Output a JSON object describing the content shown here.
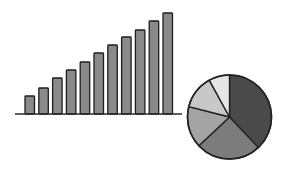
{
  "chart_data": [
    {
      "type": "bar",
      "title": "",
      "xlabel": "",
      "ylabel": "",
      "categories": [
        "1",
        "2",
        "3",
        "4",
        "5",
        "6",
        "7",
        "8",
        "9",
        "10",
        "11"
      ],
      "values": [
        18,
        26,
        36,
        44,
        52,
        61,
        69,
        77,
        84,
        93,
        101
      ],
      "grid": false,
      "legend": "none",
      "colors": {
        "fill": "#8a8a8a",
        "stroke": "#1e1e1e",
        "axis": "#2a2a2a"
      }
    },
    {
      "type": "pie",
      "title": "",
      "labels": [
        "A",
        "B",
        "C",
        "D",
        "E"
      ],
      "values": [
        38,
        25,
        16,
        13,
        8
      ],
      "start_angle": "12 o'clock, clockwise",
      "legend": "none",
      "colors": [
        "#4a4a4a",
        "#7c7c7c",
        "#a4a4a4",
        "#c8c8c8",
        "#e6e6e6"
      ],
      "stroke": "#222222"
    }
  ]
}
